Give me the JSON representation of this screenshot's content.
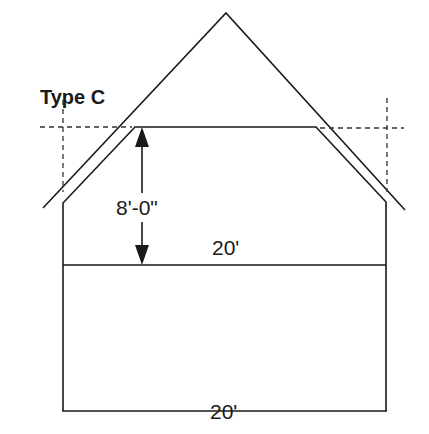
{
  "diagram": {
    "title": "Type C",
    "labels": {
      "ceiling_height": "8'-0\"",
      "room_width": "20'",
      "building_width": "20'"
    },
    "colors": {
      "line": "#1a1a1a",
      "dashed": "#333333",
      "background": "#ffffff"
    }
  }
}
